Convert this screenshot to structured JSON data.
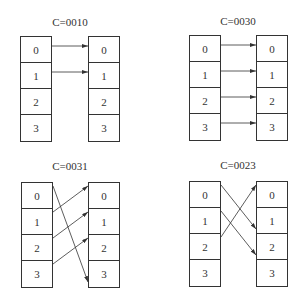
{
  "panels": [
    {
      "id": "c0010",
      "title": "C=0010",
      "left_cells": [
        "0",
        "1",
        "2",
        "3"
      ],
      "right_cells": [
        "0",
        "1",
        "2",
        "3"
      ],
      "mapping": [
        [
          0,
          0
        ],
        [
          1,
          1
        ]
      ]
    },
    {
      "id": "c0030",
      "title": "C=0030",
      "left_cells": [
        "0",
        "1",
        "2",
        "3"
      ],
      "right_cells": [
        "0",
        "1",
        "2",
        "3"
      ],
      "mapping": [
        [
          0,
          0
        ],
        [
          1,
          1
        ],
        [
          2,
          2
        ],
        [
          3,
          3
        ]
      ]
    },
    {
      "id": "c0031",
      "title": "C=0031",
      "left_cells": [
        "0",
        "1",
        "2",
        "3"
      ],
      "right_cells": [
        "0",
        "1",
        "2",
        "3"
      ],
      "mapping": [
        [
          0,
          3
        ],
        [
          1,
          0
        ],
        [
          2,
          1
        ],
        [
          3,
          2
        ]
      ]
    },
    {
      "id": "c0023",
      "title": "C=0023",
      "left_cells": [
        "0",
        "1",
        "2",
        "3"
      ],
      "right_cells": [
        "0",
        "1",
        "2",
        "3"
      ],
      "mapping": [
        [
          0,
          1
        ],
        [
          1,
          2
        ],
        [
          2,
          0
        ]
      ]
    }
  ],
  "colors": {
    "stroke": "#333333",
    "background": "#ffffff"
  }
}
